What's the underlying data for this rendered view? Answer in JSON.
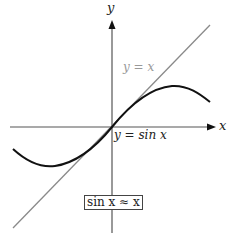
{
  "diagram": {
    "axes": {
      "x_label": "x",
      "y_label": "y"
    },
    "curves": [
      {
        "name": "line",
        "label": "y = x",
        "color": "#8a8a8a"
      },
      {
        "name": "sine",
        "label": "y = sin x",
        "color": "#111111"
      }
    ],
    "annotation": "sin x ≈ x"
  }
}
